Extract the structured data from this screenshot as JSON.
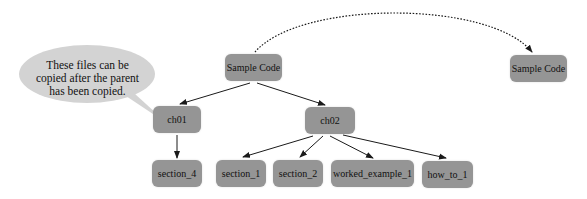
{
  "diagram": {
    "type": "tree",
    "callout": {
      "text_lines": [
        "These files can be",
        "copied after the parent",
        "has been copied."
      ]
    },
    "nodes": {
      "root": {
        "label": "Sample Code"
      },
      "copy": {
        "label": "Sample Code"
      },
      "ch01": {
        "label": "ch01"
      },
      "ch02": {
        "label": "ch02"
      },
      "section_4": {
        "label": "section_4"
      },
      "section_1": {
        "label": "section_1"
      },
      "section_2": {
        "label": "section_2"
      },
      "worked_example_1": {
        "label": "worked_example_1"
      },
      "how_to_1": {
        "label": "how_to_1"
      }
    },
    "edges": [
      {
        "from": "root",
        "to": "ch01",
        "style": "solid"
      },
      {
        "from": "root",
        "to": "ch02",
        "style": "solid"
      },
      {
        "from": "ch01",
        "to": "section_4",
        "style": "solid"
      },
      {
        "from": "ch02",
        "to": "section_1",
        "style": "solid"
      },
      {
        "from": "ch02",
        "to": "section_2",
        "style": "solid"
      },
      {
        "from": "ch02",
        "to": "worked_example_1",
        "style": "solid"
      },
      {
        "from": "ch02",
        "to": "how_to_1",
        "style": "solid"
      },
      {
        "from": "root",
        "to": "copy",
        "style": "dotted-arc"
      }
    ],
    "colors": {
      "node_fill": "#959595",
      "bubble_fill": "#d3d3d3",
      "edge": "#1a1a1a"
    }
  }
}
